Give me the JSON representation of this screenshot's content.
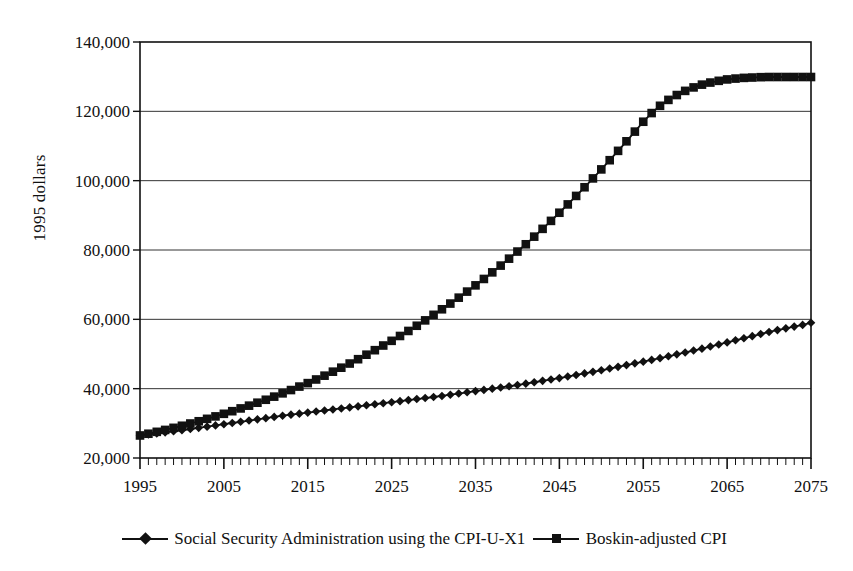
{
  "chart_data": {
    "type": "line",
    "title": "",
    "xlabel": "",
    "ylabel": "1995 dollars",
    "xlim": [
      1995,
      2075
    ],
    "ylim": [
      20000,
      140000
    ],
    "xticks": [
      1995,
      2005,
      2015,
      2025,
      2035,
      2045,
      2055,
      2065,
      2075
    ],
    "xtick_labels": [
      "1995",
      "2005",
      "2015",
      "2025",
      "2035",
      "2045",
      "2055",
      "2065",
      "2075"
    ],
    "yticks": [
      20000,
      40000,
      60000,
      80000,
      100000,
      120000,
      140000
    ],
    "ytick_labels": [
      "20,000",
      "40,000",
      "60,000",
      "80,000",
      "100,000",
      "120,000",
      "140,000"
    ],
    "minor_xtick_interval": 1,
    "grid": "horizontal",
    "legend_position": "bottom",
    "line_color": "#111111",
    "x": [
      1995,
      1996,
      1997,
      1998,
      1999,
      2000,
      2001,
      2002,
      2003,
      2004,
      2005,
      2006,
      2007,
      2008,
      2009,
      2010,
      2011,
      2012,
      2013,
      2014,
      2015,
      2016,
      2017,
      2018,
      2019,
      2020,
      2021,
      2022,
      2023,
      2024,
      2025,
      2026,
      2027,
      2028,
      2029,
      2030,
      2031,
      2032,
      2033,
      2034,
      2035,
      2036,
      2037,
      2038,
      2039,
      2040,
      2041,
      2042,
      2043,
      2044,
      2045,
      2046,
      2047,
      2048,
      2049,
      2050,
      2051,
      2052,
      2053,
      2054,
      2055,
      2056,
      2057,
      2058,
      2059,
      2060,
      2061,
      2062,
      2063,
      2064,
      2065,
      2066,
      2067,
      2068,
      2069,
      2070,
      2071,
      2072,
      2073,
      2074,
      2075
    ],
    "series": [
      {
        "name": "Social Security Administration using the CPI-U-X1",
        "marker": "diamond",
        "values": [
          26500,
          26800,
          27100,
          27400,
          27700,
          28000,
          28350,
          28700,
          29050,
          29400,
          29750,
          30100,
          30450,
          30800,
          31150,
          31500,
          31850,
          32200,
          32500,
          32800,
          33100,
          33400,
          33700,
          34000,
          34300,
          34600,
          34900,
          35200,
          35500,
          35800,
          36100,
          36400,
          36700,
          37000,
          37300,
          37600,
          37900,
          38250,
          38600,
          38950,
          39300,
          39650,
          40000,
          40350,
          40700,
          41050,
          41450,
          41850,
          42250,
          42650,
          43050,
          43500,
          43950,
          44400,
          44850,
          45300,
          45800,
          46300,
          46800,
          47300,
          47800,
          48300,
          48800,
          49350,
          49900,
          50450,
          51000,
          51550,
          52150,
          52750,
          53350,
          53950,
          54550,
          55150,
          55750,
          56350,
          56900,
          57400,
          57900,
          58400,
          59000
        ]
      },
      {
        "name": "Boskin-adjusted CPI",
        "marker": "square",
        "values": [
          26500,
          27000,
          27550,
          28100,
          28700,
          29300,
          29950,
          30600,
          31300,
          32000,
          32750,
          33500,
          34300,
          35100,
          35950,
          36800,
          37700,
          38650,
          39600,
          40600,
          41600,
          42650,
          43750,
          44900,
          46050,
          47250,
          48500,
          49800,
          51100,
          52450,
          53800,
          55200,
          56650,
          58150,
          59700,
          61300,
          62900,
          64550,
          66250,
          68000,
          69800,
          71650,
          73550,
          75500,
          77500,
          79550,
          81650,
          83850,
          86100,
          88400,
          90750,
          93150,
          95600,
          98100,
          100650,
          103250,
          105900,
          108600,
          111350,
          114150,
          117000,
          119500,
          121600,
          123300,
          124700,
          125900,
          126900,
          127700,
          128300,
          128800,
          129200,
          129450,
          129650,
          129750,
          129850,
          129900,
          129900,
          129900,
          129900,
          129900,
          129900
        ]
      }
    ],
    "notes": {
      "both_start_1995": 26500,
      "ssa_end_2075": 59000,
      "boskin_end_2075": 130000
    }
  }
}
